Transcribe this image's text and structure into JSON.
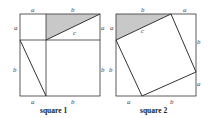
{
  "figures": [
    {
      "caption": "square 1",
      "labels": {
        "top_left": "a",
        "top_right": "b",
        "left_top": "a",
        "right_top": "a",
        "hyp": "c",
        "left_bottom": "b",
        "right_bottom": "b",
        "bottom_left": "a",
        "bottom_right": "b"
      }
    },
    {
      "caption": "square 2",
      "labels": {
        "top_left": "b",
        "top_right": "a",
        "left_top": "a",
        "right_top": "b",
        "hyp": "c",
        "left_bottom": "b",
        "right_bottom": "a",
        "bottom_left": "a",
        "bottom_right": "b"
      }
    }
  ],
  "colors": {
    "line": "#333333",
    "shade": "#c8c8c8"
  }
}
